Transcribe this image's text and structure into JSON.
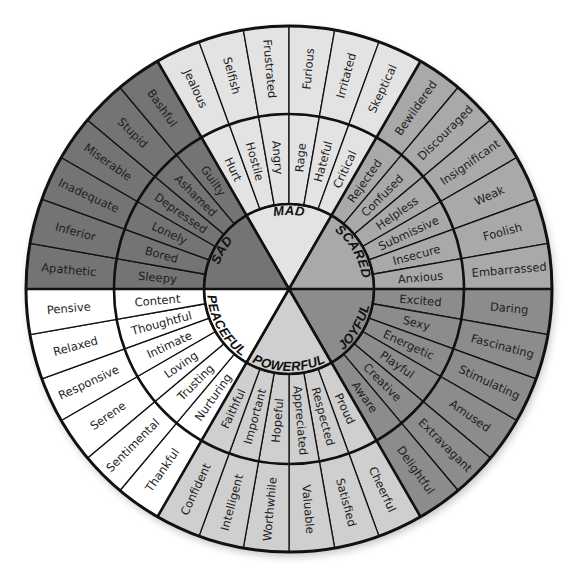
{
  "geometry": {
    "cx": 289,
    "cy": 289,
    "r_core": 85,
    "r_mid": 175,
    "r_outer": 263
  },
  "sectors": [
    {
      "name": "MAD",
      "color": "#e3e3e3",
      "start_deg": -120,
      "middle": [
        "Hurt",
        "Hostile",
        "Angry",
        "Rage",
        "Hateful",
        "Critical"
      ],
      "outer": [
        "Jealous",
        "Selfish",
        "Frustrated",
        "Furious",
        "Irritated",
        "Skeptical"
      ]
    },
    {
      "name": "SCARED",
      "color": "#a9a9a9",
      "start_deg": -60,
      "middle": [
        "Rejected",
        "Confused",
        "Helpless",
        "Submissive",
        "Insecure",
        "Anxious"
      ],
      "outer": [
        "Bewildered",
        "Discouraged",
        "Insignificant",
        "Weak",
        "Foolish",
        "Embarrassed"
      ]
    },
    {
      "name": "JOYFUL",
      "color": "#8c8c8c",
      "start_deg": 0,
      "middle": [
        "Excited",
        "Sexy",
        "Energetic",
        "Playful",
        "Creative",
        "Aware"
      ],
      "outer": [
        "Daring",
        "Fascinating",
        "Stimulating",
        "Amused",
        "Extravagant",
        "Delightful"
      ]
    },
    {
      "name": "POWERFUL",
      "color": "#cfcfcf",
      "start_deg": 60,
      "middle": [
        "Proud",
        "Respected",
        "Appreciated",
        "Hopeful",
        "Important",
        "Faithful"
      ],
      "outer": [
        "Cheerful",
        "Satisfied",
        "Valuable",
        "Worthwhile",
        "Intelligent",
        "Confident"
      ]
    },
    {
      "name": "PEACEFUL",
      "color": "#ffffff",
      "start_deg": 120,
      "middle": [
        "Nurturing",
        "Trusting",
        "Loving",
        "Intimate",
        "Thoughtful",
        "Content"
      ],
      "outer": [
        "Thankful",
        "Sentimental",
        "Serene",
        "Responsive",
        "Relaxed",
        "Pensive"
      ]
    },
    {
      "name": "SAD",
      "color": "#747474",
      "start_deg": 180,
      "middle": [
        "Sleepy",
        "Bored",
        "Lonely",
        "Depressed",
        "Ashamed",
        "Guilty"
      ],
      "outer": [
        "Apathetic",
        "Inferior",
        "Inadequate",
        "Miserable",
        "Stupid",
        "Bashful"
      ]
    }
  ],
  "colors": {
    "stroke": "#111111",
    "text": "#1e1e1e"
  }
}
